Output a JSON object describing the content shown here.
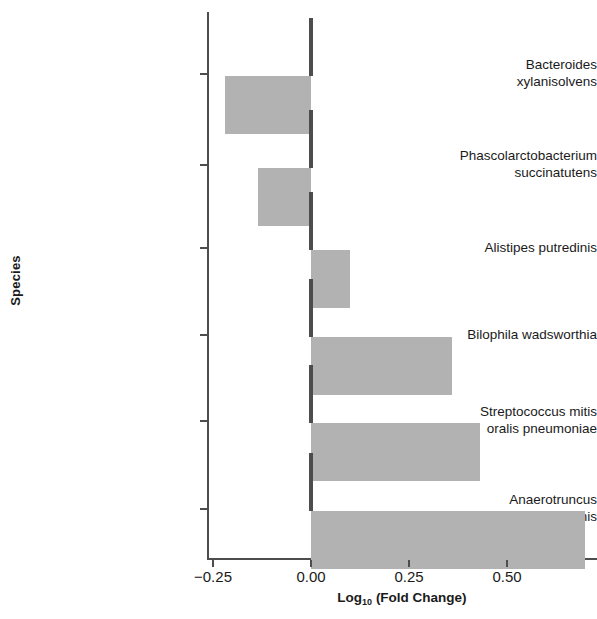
{
  "chart_data": {
    "type": "bar",
    "orientation": "horizontal",
    "title": "",
    "xlabel": "Log10 (Fold Change)",
    "ylabel": "Species",
    "categories": [
      "Bacteroides\nxylanisolvens",
      "Phascolarctobacterium\nsuccinatutens",
      "Alistipes putredinis",
      "Bilophila wadsworthia",
      "Streptococcus mitis\noralis pneumoniae",
      "Anaerotruncus\ncolihominis"
    ],
    "values": [
      -0.22,
      -0.135,
      0.1,
      0.36,
      0.43,
      0.7
    ],
    "xlim": [
      -0.28,
      0.73
    ],
    "xticks": [
      -0.25,
      0.0,
      0.25,
      0.5
    ],
    "xtick_labels": [
      "−0.25",
      "0.00",
      "0.25",
      "0.50"
    ],
    "grid": false,
    "legend": false,
    "bar_color": "#b2b2b2",
    "axis_color": "#4d4d4d",
    "background": "#ffffff"
  },
  "axes": {
    "x_title_main": "Log",
    "x_title_sub": "10",
    "x_title_rest": " (Fold Change)",
    "y_title": "Species"
  },
  "y_tick_labels": [
    "Bacteroides\nxylanisolvens",
    "Phascolarctobacterium\nsuccinatutens",
    "Alistipes putredinis",
    "Bilophila wadsworthia",
    "Streptococcus mitis\noralis pneumoniae",
    "Anaerotruncus\ncolihominis"
  ],
  "x_tick_labels": [
    "−0.25",
    "0.00",
    "0.25",
    "0.50"
  ]
}
